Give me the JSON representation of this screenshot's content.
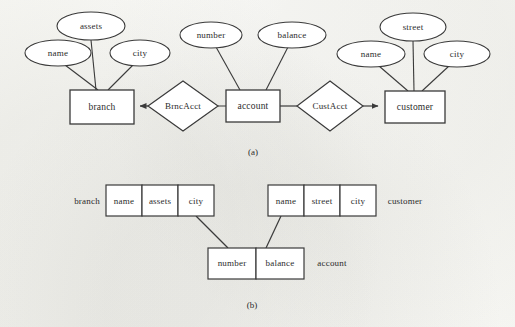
{
  "figure": {
    "caption_a": "(a)",
    "caption_b": "(b)",
    "stroke_color": "#3a3a3a",
    "fill_color": "#ffffff",
    "background_color": "#fbfbf9"
  },
  "er_diagram": {
    "entities": [
      {
        "name": "branch",
        "label": "branch",
        "cx": 102,
        "cy": 107,
        "w": 64,
        "h": 34
      },
      {
        "name": "account",
        "label": "account",
        "cx": 253,
        "cy": 106,
        "w": 54,
        "h": 32
      },
      {
        "name": "customer",
        "label": "customer",
        "cx": 415,
        "cy": 107,
        "w": 60,
        "h": 32
      }
    ],
    "relationships": [
      {
        "name": "BrncAcct",
        "label": "BrncAcct",
        "cx": 183,
        "cy": 106,
        "rx": 35,
        "ry": 25,
        "arrow_to": "branch"
      },
      {
        "name": "CustAcct",
        "label": "CustAcct",
        "cx": 330,
        "cy": 106,
        "rx": 33,
        "ry": 25,
        "arrow_to": "customer"
      }
    ],
    "attributes": [
      {
        "name": "branch-assets",
        "label": "assets",
        "owner": "branch",
        "cx": 91,
        "cy": 26,
        "rx": 34,
        "ry": 14
      },
      {
        "name": "branch-name",
        "label": "name",
        "owner": "branch",
        "cx": 58,
        "cy": 53,
        "rx": 33,
        "ry": 13
      },
      {
        "name": "branch-city",
        "label": "city",
        "owner": "branch",
        "cx": 140,
        "cy": 53,
        "rx": 30,
        "ry": 13
      },
      {
        "name": "account-number",
        "label": "number",
        "owner": "account",
        "cx": 211,
        "cy": 35,
        "rx": 31,
        "ry": 13
      },
      {
        "name": "account-balance",
        "label": "balance",
        "owner": "account",
        "cx": 292,
        "cy": 35,
        "rx": 34,
        "ry": 13
      },
      {
        "name": "customer-street",
        "label": "street",
        "owner": "customer",
        "cx": 413,
        "cy": 27,
        "rx": 33,
        "ry": 14
      },
      {
        "name": "customer-name",
        "label": "name",
        "owner": "customer",
        "cx": 371,
        "cy": 54,
        "rx": 34,
        "ry": 13
      },
      {
        "name": "customer-city",
        "label": "city",
        "owner": "customer",
        "cx": 457,
        "cy": 54,
        "rx": 33,
        "ry": 13
      }
    ]
  },
  "relational_schema": {
    "relations": [
      {
        "name": "branch",
        "label": "branch",
        "label_side": "left",
        "label_x": 87,
        "label_y": 201,
        "x": 106,
        "y": 185,
        "cell_w": 36,
        "h": 31,
        "attributes": [
          "name",
          "assets",
          "city"
        ]
      },
      {
        "name": "customer",
        "label": "customer",
        "label_side": "right",
        "label_x": 405,
        "label_y": 201,
        "x": 268,
        "y": 185,
        "cell_w": 36,
        "h": 31,
        "attributes": [
          "name",
          "street",
          "city"
        ]
      },
      {
        "name": "account",
        "label": "account",
        "label_side": "right",
        "label_x": 332,
        "label_y": 263,
        "x": 208,
        "y": 248,
        "cell_w": 48,
        "h": 31,
        "attributes": [
          "number",
          "balance"
        ]
      }
    ],
    "links": [
      {
        "name": "account-to-branch-city",
        "from": "account.number",
        "to": "branch.city"
      },
      {
        "name": "account-to-customer-name",
        "from": "account.balance",
        "to": "customer.name"
      }
    ]
  }
}
